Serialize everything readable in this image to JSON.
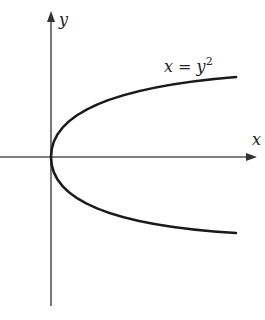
{
  "diagram": {
    "title": "",
    "axes": {
      "x_label": "x",
      "y_label": "y"
    },
    "curve": {
      "equation_lhs": "x = y",
      "equation_exp": "2",
      "description": "Parabola opening to the right with vertex at the origin"
    },
    "colors": {
      "axis": "#555555",
      "curve": "#1a1a1a",
      "background": "#ffffff"
    }
  }
}
